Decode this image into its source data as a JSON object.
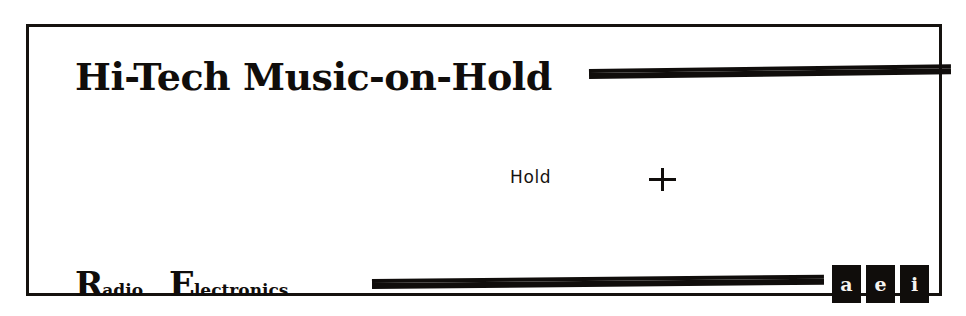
{
  "figure": {
    "caption_title": "Hi-Tech Music-on-Hold",
    "background_color": "#ffffff",
    "ink_color": "#100d0b",
    "frame": {
      "border_color": "#15120f",
      "border_width_px": 3
    }
  },
  "masthead": {
    "title": "Hi-Tech Music-on-Hold"
  },
  "rules": {
    "top": {
      "style": "double-bar"
    },
    "bottom": {
      "style": "double-bar"
    }
  },
  "callout": {
    "label": "Hold",
    "marker_icon": "plus-crosshair-icon"
  },
  "brand": {
    "words": [
      {
        "dropcap": "R",
        "rest": "adio"
      },
      {
        "dropcap": "E",
        "rest": "lectronics"
      }
    ]
  },
  "glyph_tiles": {
    "items": [
      {
        "glyph": "a",
        "icon": "inverted-glyph-tile-1"
      },
      {
        "glyph": "e",
        "icon": "inverted-glyph-tile-2"
      },
      {
        "glyph": "i",
        "icon": "inverted-glyph-tile-3"
      }
    ]
  }
}
